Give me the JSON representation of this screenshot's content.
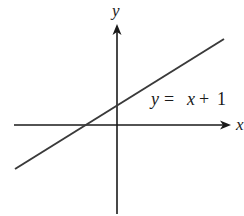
{
  "diagram": {
    "type": "coordinate-plane-line",
    "axes": {
      "x_label": "x",
      "y_label": "y"
    },
    "line": {
      "equation_label": "y = x + 1",
      "label_parts": {
        "lhs": "y",
        "eq": "=",
        "var": "x",
        "plus": "+",
        "const": "1"
      },
      "slope": 1,
      "y_intercept": 1,
      "x_intercept": -1
    },
    "colors": {
      "stroke": "#1a1a1a",
      "line": "#3a3a3a",
      "background": "#ffffff"
    }
  }
}
